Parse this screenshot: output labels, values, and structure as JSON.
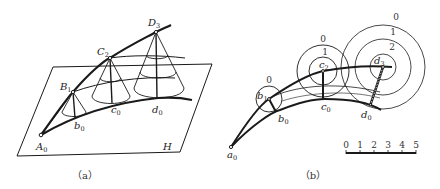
{
  "figure_a": {
    "caption": "（a）",
    "plane_label": "H",
    "points": {
      "A0": {
        "base": "A",
        "sub": "0"
      },
      "B1": {
        "base": "B",
        "sub": "1"
      },
      "C2": {
        "base": "C",
        "sub": "2"
      },
      "D3": {
        "base": "D",
        "sub": "3"
      },
      "b0": {
        "base": "b",
        "sub": "0"
      },
      "c0": {
        "base": "c",
        "sub": "0"
      },
      "d0": {
        "base": "d",
        "sub": "0"
      }
    }
  },
  "figure_b": {
    "caption": "（b）",
    "points": {
      "a0": {
        "base": "a",
        "sub": "0"
      },
      "b1": {
        "base": "b",
        "sub": "1"
      },
      "c2": {
        "base": "c",
        "sub": "2"
      },
      "d3": {
        "base": "d",
        "sub": "3"
      },
      "b0": {
        "base": "b",
        "sub": "0"
      },
      "c0": {
        "base": "c",
        "sub": "0"
      },
      "d0": {
        "base": "d",
        "sub": "0"
      }
    },
    "contour_labels": {
      "b1_circle": [
        "0"
      ],
      "c2_circles": [
        "0",
        "1"
      ],
      "d3_circles": [
        "0",
        "1",
        "2"
      ]
    },
    "scale_bar": {
      "ticks": [
        "0",
        "1",
        "2",
        "3",
        "4",
        "5"
      ]
    }
  },
  "colors": {
    "line": "#1a1a1a",
    "background": "#ffffff"
  }
}
